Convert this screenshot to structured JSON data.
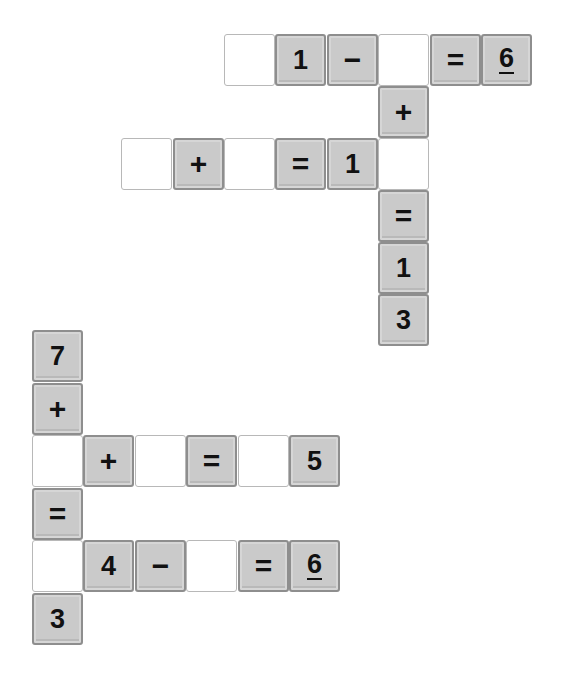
{
  "puzzles": [
    {
      "name": "puzzle-top",
      "origin": {
        "x": 224,
        "y": 34
      },
      "pitch": {
        "x": 51.4,
        "y": 52
      },
      "tiles": [
        {
          "row": 0,
          "col": 0,
          "type": "blank",
          "value": ""
        },
        {
          "row": 0,
          "col": 1,
          "type": "given",
          "value": "1"
        },
        {
          "row": 0,
          "col": 2,
          "type": "given",
          "value": "−"
        },
        {
          "row": 0,
          "col": 3,
          "type": "blank",
          "value": ""
        },
        {
          "row": 0,
          "col": 4,
          "type": "given",
          "value": "="
        },
        {
          "row": 0,
          "col": 5,
          "type": "given",
          "value": "6",
          "underline": true
        },
        {
          "row": 1,
          "col": 3,
          "type": "given",
          "value": "+"
        },
        {
          "row": 2,
          "col": -2,
          "type": "blank",
          "value": ""
        },
        {
          "row": 2,
          "col": -1,
          "type": "given",
          "value": "+"
        },
        {
          "row": 2,
          "col": 0,
          "type": "blank",
          "value": ""
        },
        {
          "row": 2,
          "col": 1,
          "type": "given",
          "value": "="
        },
        {
          "row": 2,
          "col": 2,
          "type": "given",
          "value": "1"
        },
        {
          "row": 2,
          "col": 3,
          "type": "blank",
          "value": ""
        },
        {
          "row": 3,
          "col": 3,
          "type": "given",
          "value": "="
        },
        {
          "row": 4,
          "col": 3,
          "type": "given",
          "value": "1"
        },
        {
          "row": 5,
          "col": 3,
          "type": "given",
          "value": "3"
        }
      ]
    },
    {
      "name": "puzzle-bottom",
      "origin": {
        "x": 32,
        "y": 330
      },
      "pitch": {
        "x": 51.4,
        "y": 52.6
      },
      "tiles": [
        {
          "row": 0,
          "col": 0,
          "type": "given",
          "value": "7"
        },
        {
          "row": 1,
          "col": 0,
          "type": "given",
          "value": "+"
        },
        {
          "row": 2,
          "col": 0,
          "type": "blank",
          "value": ""
        },
        {
          "row": 2,
          "col": 1,
          "type": "given",
          "value": "+"
        },
        {
          "row": 2,
          "col": 2,
          "type": "blank",
          "value": ""
        },
        {
          "row": 2,
          "col": 3,
          "type": "given",
          "value": "="
        },
        {
          "row": 2,
          "col": 4,
          "type": "blank",
          "value": ""
        },
        {
          "row": 2,
          "col": 5,
          "type": "given",
          "value": "5"
        },
        {
          "row": 3,
          "col": 0,
          "type": "given",
          "value": "="
        },
        {
          "row": 4,
          "col": 0,
          "type": "blank",
          "value": ""
        },
        {
          "row": 4,
          "col": 1,
          "type": "given",
          "value": "4"
        },
        {
          "row": 4,
          "col": 2,
          "type": "given",
          "value": "−"
        },
        {
          "row": 4,
          "col": 3,
          "type": "blank",
          "value": ""
        },
        {
          "row": 4,
          "col": 4,
          "type": "given",
          "value": "="
        },
        {
          "row": 4,
          "col": 5,
          "type": "given",
          "value": "6",
          "underline": true
        },
        {
          "row": 5,
          "col": 0,
          "type": "given",
          "value": "3"
        }
      ]
    }
  ],
  "colors": {
    "given_fill": "#cacaca",
    "given_border": "#8e8e8e",
    "blank_fill": "#ffffff",
    "blank_border": "#b8b8b8",
    "glyph": "#111111"
  }
}
